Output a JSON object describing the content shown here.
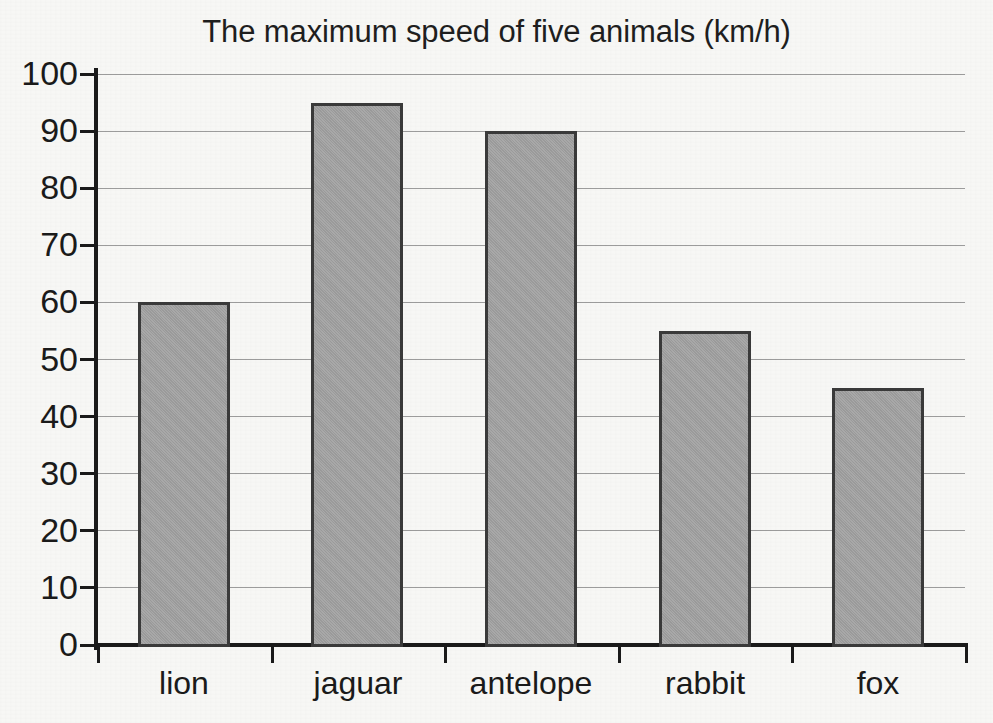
{
  "chart_data": {
    "type": "bar",
    "title": "The maximum speed of five animals (km/h)",
    "xlabel": "",
    "ylabel": "",
    "categories": [
      "lion",
      "jaguar",
      "antelope",
      "rabbit",
      "fox"
    ],
    "values": [
      60,
      95,
      90,
      55,
      45
    ],
    "ylim": [
      0,
      100
    ],
    "ytick_labels": [
      "100",
      "90",
      "80",
      "70",
      "60",
      "50",
      "40",
      "30",
      "20",
      "10",
      "0"
    ],
    "ytick_values": [
      100,
      90,
      80,
      70,
      60,
      50,
      40,
      30,
      20,
      10,
      0
    ],
    "ytick_step": 10,
    "grid": "horizontal",
    "legend": "none",
    "bar_fill_color": "#a3a3a3",
    "bar_edge_color": "#3a3a3a",
    "axis_color": "#1a1a1a",
    "gridline_color": "#8c8c8c",
    "background_color": "#f7f7f5"
  }
}
